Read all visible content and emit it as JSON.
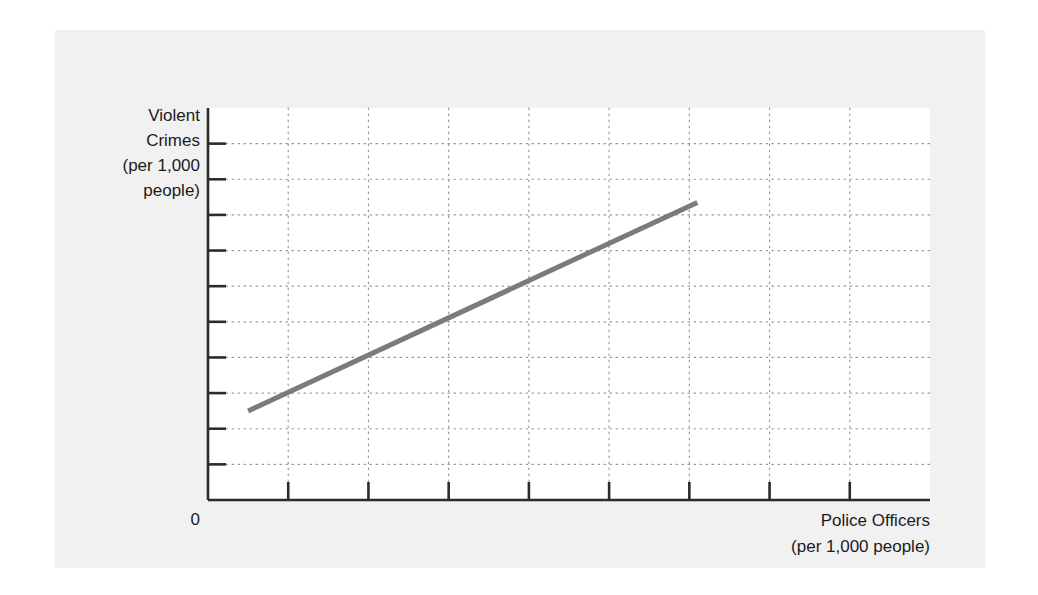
{
  "figure": {
    "background_color": "#ffffff",
    "panel_color": "#f1f1f1",
    "plot_background_color": "#ffffff"
  },
  "labels": {
    "y_axis_title": "Violent\nCrimes\n(per 1,000\npeople)",
    "x_axis_title": "Police Officers\n(per 1,000 people)",
    "origin": "0"
  },
  "chart_data": {
    "type": "line",
    "title": "",
    "xlabel": "Police Officers (per 1,000 people)",
    "ylabel": "Violent Crimes (per 1,000 people)",
    "annotations": [],
    "legend": [],
    "legend_position": "none",
    "grid": true,
    "grid_style": "dotted",
    "grid_color": "#9a9a9a",
    "axis_color": "#2b2b2b",
    "xlim": [
      0,
      9
    ],
    "ylim": [
      0,
      11
    ],
    "x_ticks": [
      1,
      2,
      3,
      4,
      5,
      6,
      7,
      8
    ],
    "x_tick_labels": [
      "",
      "",
      "",
      "",
      "",
      "",
      "",
      ""
    ],
    "y_ticks": [
      1,
      2,
      3,
      4,
      5,
      6,
      7,
      8,
      9,
      10
    ],
    "y_tick_labels": [
      "",
      "",
      "",
      "",
      "",
      "",
      "",
      "",
      "",
      ""
    ],
    "series": [
      {
        "name": "trend",
        "color": "#7b7b7b",
        "line_width": 5,
        "x": [
          0.5,
          6.1
        ],
        "y": [
          2.5,
          8.35
        ]
      }
    ]
  }
}
